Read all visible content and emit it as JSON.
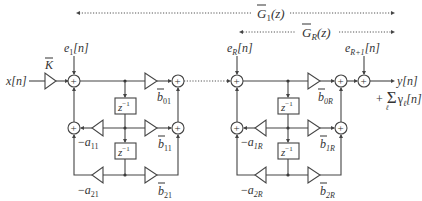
{
  "diagram": {
    "type": "cascaded second-order section filter block diagram",
    "input_label": "x[n]",
    "gain_label": "K",
    "output_label": "y[n]",
    "output_sum_term": "+ Σ γℓ[n]",
    "output_sum_plus": "+",
    "output_sum_sigma": "Σ",
    "output_sum_gamma": "γ",
    "output_sum_index": "ℓ",
    "output_sum_tail": "[n]",
    "delay_label_base": "z",
    "delay_label_exp": "−1",
    "sum_symbol": "+",
    "ranges": {
      "g1": {
        "label_base": "G",
        "label_sub": "1",
        "label_tail": "(z)"
      },
      "gr": {
        "label_base": "G",
        "label_sub": "R",
        "label_tail": "(z)"
      }
    },
    "sections": [
      {
        "name": "section-1",
        "error_input": {
          "base": "e",
          "sub": "1",
          "tail": "[n]"
        },
        "feedforward": [
          {
            "base": "b",
            "sub": "01"
          },
          {
            "base": "b",
            "sub": "11"
          },
          {
            "base": "b",
            "sub": "21"
          }
        ],
        "feedback": [
          {
            "prefix": "−",
            "base": "a",
            "sub": "11"
          },
          {
            "prefix": "−",
            "base": "a",
            "sub": "21"
          }
        ]
      },
      {
        "name": "section-R",
        "error_input": {
          "base": "e",
          "sub": "R",
          "tail": "[n]"
        },
        "feedforward": [
          {
            "base": "b",
            "sub": "0R"
          },
          {
            "base": "b",
            "sub": "1R"
          },
          {
            "base": "b",
            "sub": "2R"
          }
        ],
        "feedback": [
          {
            "prefix": "−",
            "base": "a",
            "sub": "1R"
          },
          {
            "prefix": "−",
            "base": "a",
            "sub": "2R"
          }
        ]
      }
    ],
    "final_error_input": {
      "base": "e",
      "sub": "R+1",
      "tail": "[n]"
    }
  }
}
